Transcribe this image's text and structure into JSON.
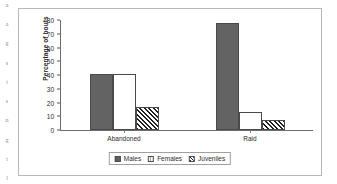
{
  "edge_fragments": [
    "a",
    "a",
    "g",
    "s",
    "t",
    "s",
    "n",
    "g",
    "t",
    "l"
  ],
  "chart_data": {
    "type": "bar",
    "title": "",
    "xlabel": "",
    "ylabel": "Percentage of bouts",
    "categories": [
      "Abandoned",
      "Raid"
    ],
    "series": [
      {
        "name": "Males",
        "values": [
          41,
          78
        ],
        "fill": "solid-dark-gray",
        "color": "#636363"
      },
      {
        "name": "Females",
        "values": [
          41,
          13
        ],
        "fill": "fine-dotted-light",
        "color": "#fdfdfd"
      },
      {
        "name": "Juveniles",
        "values": [
          17,
          7
        ],
        "fill": "diagonal-hatch",
        "color": "#ffffff"
      }
    ],
    "ylim": [
      0,
      80
    ],
    "yticks": [
      0,
      10,
      20,
      30,
      40,
      50,
      60,
      70,
      80
    ],
    "ytick_labels": [
      "0",
      "10",
      "20",
      "30",
      "40",
      "50",
      "60",
      "70",
      "80"
    ],
    "grid": false,
    "legend_position": "bottom-center"
  }
}
